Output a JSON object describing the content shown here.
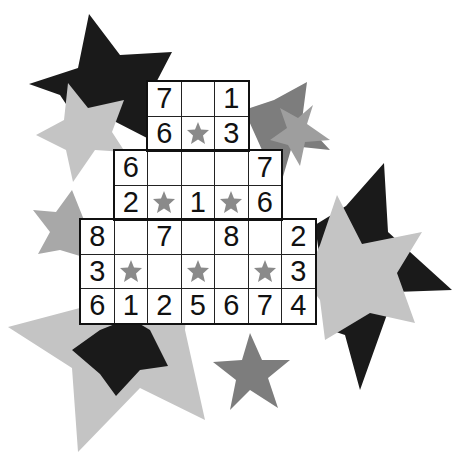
{
  "puzzle": {
    "type": "number-grid-puzzle",
    "colors": {
      "black_star": "#1a1a1a",
      "dark_grey_star": "#7d7d7d",
      "mid_grey_star": "#999999",
      "light_grey_star": "#c4c4c4",
      "cell_star": "#8a8a8a",
      "grid_line": "#222222"
    },
    "rows": [
      {
        "row": 0,
        "cells": [
          {
            "col": 2,
            "value": "7"
          },
          {
            "col": 3,
            "value": ""
          },
          {
            "col": 4,
            "value": "1"
          }
        ]
      },
      {
        "row": 1,
        "cells": [
          {
            "col": 2,
            "value": "6"
          },
          {
            "col": 3,
            "value": "",
            "star": true
          },
          {
            "col": 4,
            "value": "3"
          }
        ]
      },
      {
        "row": 2,
        "cells": [
          {
            "col": 1,
            "value": "6"
          },
          {
            "col": 2,
            "value": ""
          },
          {
            "col": 3,
            "value": ""
          },
          {
            "col": 4,
            "value": ""
          },
          {
            "col": 5,
            "value": "7"
          }
        ]
      },
      {
        "row": 3,
        "cells": [
          {
            "col": 1,
            "value": "2"
          },
          {
            "col": 2,
            "value": "",
            "star": true
          },
          {
            "col": 3,
            "value": "1"
          },
          {
            "col": 4,
            "value": "",
            "star": true
          },
          {
            "col": 5,
            "value": "6"
          }
        ]
      },
      {
        "row": 4,
        "cells": [
          {
            "col": 0,
            "value": "8"
          },
          {
            "col": 1,
            "value": ""
          },
          {
            "col": 2,
            "value": "7"
          },
          {
            "col": 3,
            "value": ""
          },
          {
            "col": 4,
            "value": "8"
          },
          {
            "col": 5,
            "value": ""
          },
          {
            "col": 6,
            "value": "2"
          }
        ]
      },
      {
        "row": 5,
        "cells": [
          {
            "col": 0,
            "value": "3"
          },
          {
            "col": 1,
            "value": "",
            "star": true
          },
          {
            "col": 2,
            "value": ""
          },
          {
            "col": 3,
            "value": "",
            "star": true
          },
          {
            "col": 4,
            "value": ""
          },
          {
            "col": 5,
            "value": "",
            "star": true
          },
          {
            "col": 6,
            "value": "3"
          }
        ]
      },
      {
        "row": 6,
        "cells": [
          {
            "col": 0,
            "value": "6"
          },
          {
            "col": 1,
            "value": "1"
          },
          {
            "col": 2,
            "value": "2"
          },
          {
            "col": 3,
            "value": "5"
          },
          {
            "col": 4,
            "value": "6"
          },
          {
            "col": 5,
            "value": "7"
          },
          {
            "col": 6,
            "value": "4"
          }
        ]
      }
    ]
  },
  "background_stars": [
    {
      "name": "black-star-top-left",
      "color": "#1a1a1a"
    },
    {
      "name": "light-grey-star-left",
      "color": "#c4c4c4"
    },
    {
      "name": "dark-grey-star-top-right",
      "color": "#7d7d7d"
    },
    {
      "name": "mid-grey-star-top-right",
      "color": "#9e9e9e"
    },
    {
      "name": "grey-star-left-mid",
      "color": "#a8a8a8"
    },
    {
      "name": "black-star-right",
      "color": "#1a1a1a"
    },
    {
      "name": "light-grey-star-right",
      "color": "#c4c4c4"
    },
    {
      "name": "light-grey-star-bottom-left",
      "color": "#c4c4c4"
    },
    {
      "name": "black-star-bottom-left",
      "color": "#1a1a1a"
    },
    {
      "name": "dark-grey-star-bottom-center",
      "color": "#7d7d7d"
    }
  ]
}
